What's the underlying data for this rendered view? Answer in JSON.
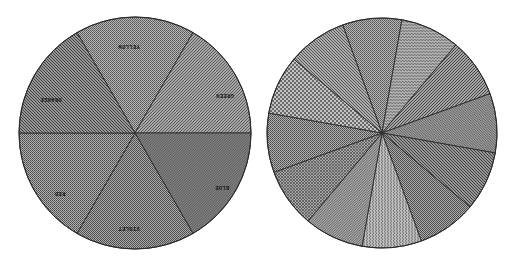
{
  "chart_data": [
    {
      "type": "pie",
      "title": "",
      "description": "Color wheel pie with six equal sectors, each filled with a distinct monochrome hatch pattern",
      "center": [
        135,
        133
      ],
      "radius": 116,
      "start_angle_deg": -120,
      "categories": [
        "YELLOW",
        "GREEN",
        "BLUE",
        "VIOLET",
        "RED",
        "ORANGE"
      ],
      "values": [
        1,
        1,
        1,
        1,
        1,
        1
      ],
      "patterns": [
        "fine-check",
        "fine-diag-right",
        "dense-diag-right",
        "fine-check-2",
        "fine-check-3",
        "diag-left"
      ],
      "label_positions": [
        [
          129,
          46
        ],
        [
          225,
          95
        ],
        [
          222,
          187
        ],
        [
          129,
          228
        ],
        [
          60,
          193
        ],
        [
          51,
          99
        ]
      ],
      "label_rotation_deg": 180
    },
    {
      "type": "pie",
      "title": "",
      "description": "Unlabeled pie with twelve equal sectors, each filled with a distinct monochrome pattern",
      "center": [
        382,
        133
      ],
      "radius": 115,
      "start_angle_deg": -110,
      "categories": [
        "",
        "",
        "",
        "",
        "",
        "",
        "",
        "",
        "",
        "",
        "",
        ""
      ],
      "values": [
        1,
        1,
        1,
        1,
        1,
        1,
        1,
        1,
        1,
        1,
        1,
        1
      ],
      "patterns": [
        "fine-check",
        "wave-h",
        "diag-right",
        "fine-diag-left",
        "diag-left",
        "fine-check-2",
        "wave-v",
        "diag-right-2",
        "cross-hatch",
        "fine-check-3",
        "basket",
        "diag-left-2"
      ]
    }
  ],
  "colors": {
    "background": "#ffffff",
    "outline": "#2a2a2a",
    "fill_base": "#9a9a9a"
  }
}
